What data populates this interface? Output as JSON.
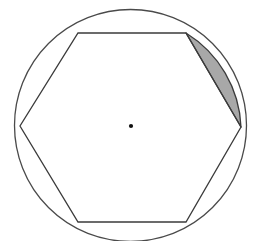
{
  "figure": {
    "canvas": {
      "width": 255,
      "height": 241,
      "background": "#ffffff"
    },
    "colors": {
      "stroke": "#3b3b3b",
      "arc_stroke": "#4a4a4a",
      "segment_fill": "#a8a8a8",
      "segment_stroke": "#3b3b3b",
      "center_dot": "#111111",
      "background": "#ffffff"
    },
    "stroke_widths": {
      "circle": 1.3,
      "hexagon": 1.3,
      "segment": 1.3
    },
    "circle": {
      "label": "circumscribed-circle",
      "cx": 130.5,
      "cy": 125.5,
      "r": 116.0
    },
    "center_point": {
      "label": "center-dot",
      "cx": 131,
      "cy": 126,
      "r": 2.1
    },
    "hexagon": {
      "label": "inscribed-hexagon",
      "sides": 6,
      "vertices": [
        {
          "name": "top-left",
          "x": 78,
          "y": 33
        },
        {
          "name": "top-right",
          "x": 186,
          "y": 33
        },
        {
          "name": "right",
          "x": 241,
          "y": 127
        },
        {
          "name": "bottom-right",
          "x": 186,
          "y": 222
        },
        {
          "name": "bottom-left",
          "x": 78,
          "y": 222
        },
        {
          "name": "left",
          "x": 20,
          "y": 126
        }
      ],
      "points_attr": "78,33 186,33 241,127 186,222 78,222 20,126"
    },
    "shaded_segment": {
      "label": "circular-segment-upper-right",
      "chord_from": {
        "x": 186,
        "y": 33
      },
      "chord_to": {
        "x": 241,
        "y": 127
      },
      "arc_radius": 116.0,
      "arc_large_flag": 0,
      "arc_sweep_flag": 1,
      "path_d": "M 186 33 A 116 116 0 0 1 241 127 L 186 33 Z",
      "fill": "#a8a8a8"
    }
  }
}
